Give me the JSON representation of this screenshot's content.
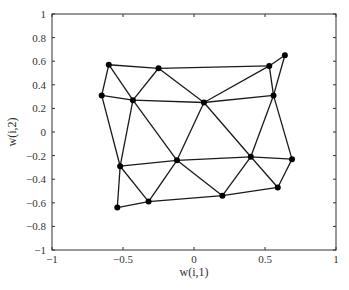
{
  "chart_data": {
    "type": "scatter",
    "subtype": "network-graph",
    "title": "",
    "xlabel": "w(i,1)",
    "ylabel": "w(i,2)",
    "xlim": [
      -1,
      1
    ],
    "ylim": [
      -1,
      1
    ],
    "xticks": [
      -1,
      -0.5,
      0,
      0.5,
      1
    ],
    "xtick_labels": [
      "−1",
      "−0.5",
      "0",
      "0.5",
      "1"
    ],
    "yticks": [
      1,
      0.8,
      0.6,
      0.4,
      0.2,
      0,
      -0.2,
      -0.4,
      -0.6,
      -0.8,
      -1
    ],
    "ytick_labels": [
      "1",
      "0.8",
      "0.6",
      "0.4",
      "0.2",
      "0",
      "−0.2",
      "−0.4",
      "−0.6",
      "−0.8",
      "−1"
    ],
    "grid": false,
    "legend": null,
    "nodes": [
      {
        "id": "A",
        "x": -0.6,
        "y": 0.57
      },
      {
        "id": "B",
        "x": -0.25,
        "y": 0.54
      },
      {
        "id": "C",
        "x": 0.53,
        "y": 0.56
      },
      {
        "id": "D",
        "x": 0.64,
        "y": 0.65
      },
      {
        "id": "E",
        "x": -0.65,
        "y": 0.31
      },
      {
        "id": "F",
        "x": -0.43,
        "y": 0.27
      },
      {
        "id": "G",
        "x": 0.07,
        "y": 0.25
      },
      {
        "id": "H",
        "x": 0.56,
        "y": 0.31
      },
      {
        "id": "I",
        "x": -0.52,
        "y": -0.29
      },
      {
        "id": "J",
        "x": -0.12,
        "y": -0.24
      },
      {
        "id": "K",
        "x": 0.4,
        "y": -0.21
      },
      {
        "id": "L",
        "x": 0.69,
        "y": -0.23
      },
      {
        "id": "M",
        "x": -0.54,
        "y": -0.64
      },
      {
        "id": "N",
        "x": -0.32,
        "y": -0.59
      },
      {
        "id": "O",
        "x": 0.2,
        "y": -0.54
      },
      {
        "id": "P",
        "x": 0.59,
        "y": -0.47
      }
    ],
    "edges": [
      [
        "A",
        "B"
      ],
      [
        "B",
        "C"
      ],
      [
        "C",
        "D"
      ],
      [
        "E",
        "F"
      ],
      [
        "F",
        "G"
      ],
      [
        "G",
        "H"
      ],
      [
        "I",
        "J"
      ],
      [
        "J",
        "K"
      ],
      [
        "K",
        "L"
      ],
      [
        "M",
        "N"
      ],
      [
        "N",
        "O"
      ],
      [
        "O",
        "P"
      ],
      [
        "A",
        "E"
      ],
      [
        "E",
        "I"
      ],
      [
        "I",
        "M"
      ],
      [
        "A",
        "F"
      ],
      [
        "B",
        "F"
      ],
      [
        "B",
        "G"
      ],
      [
        "C",
        "G"
      ],
      [
        "C",
        "H"
      ],
      [
        "D",
        "H"
      ],
      [
        "F",
        "I"
      ],
      [
        "F",
        "J"
      ],
      [
        "G",
        "J"
      ],
      [
        "G",
        "K"
      ],
      [
        "H",
        "K"
      ],
      [
        "H",
        "L"
      ],
      [
        "I",
        "N"
      ],
      [
        "J",
        "N"
      ],
      [
        "J",
        "O"
      ],
      [
        "K",
        "O"
      ],
      [
        "K",
        "P"
      ],
      [
        "L",
        "P"
      ]
    ]
  }
}
